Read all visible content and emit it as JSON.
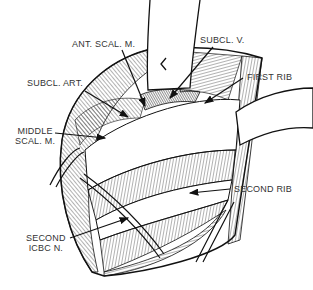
{
  "figure": {
    "type": "anatomical-illustration",
    "style": "black-and-white line drawing",
    "colors": {
      "ink": "#111111",
      "background": "#ffffff",
      "label_text": "#333333"
    }
  },
  "labels": {
    "ant_scal_m": "ANT. SCAL. M.",
    "subcl_v": "SUBCL. V.",
    "subcl_art": "SUBCL. ART.",
    "first_rib": "FIRST RIB",
    "middle_scal_m_line1": "MIDDLE",
    "middle_scal_m_line2": "SCAL. M.",
    "second_rib": "SECOND RIB",
    "second_icbc_n_line1": "SECOND",
    "second_icbc_n_line2": "ICBC N."
  }
}
